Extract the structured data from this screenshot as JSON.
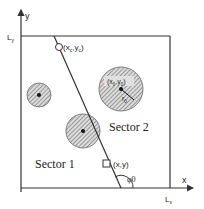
{
  "diagram": {
    "axes": {
      "x_label": "x",
      "y_label": "y",
      "x_extent_label": "Lx",
      "y_extent_label": "Ly"
    },
    "sectors": [
      {
        "label": "Sector 1"
      },
      {
        "label": "Sector 2"
      }
    ],
    "points": {
      "line_point_label": "(xc,yc)",
      "sample_point_label": "(x,y)",
      "obstacle_center_label": "(x0,y0)",
      "radius_label": "r0",
      "angle_label": "φ0"
    },
    "colors": {
      "stroke": "#333333",
      "hatch": "#555555",
      "fill": "#d9d9d9"
    }
  }
}
